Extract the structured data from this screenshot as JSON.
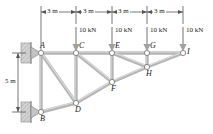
{
  "figure": {
    "type": "truss-free-body-diagram",
    "title": "",
    "colors": {
      "member": "#b9b9b9",
      "member_edge": "#8f8f8f",
      "node_fill": "#ffffff",
      "node_edge": "#6e6e6e",
      "dimension": "#4a4a4a",
      "load_arrow": "#9a9a9a",
      "support": "#c9c9c9",
      "text": "#1a1a1a"
    },
    "nodes": [
      {
        "id": "A",
        "x": 41,
        "y": 53,
        "label": "A",
        "label_dx": -1,
        "label_dy": -11
      },
      {
        "id": "B",
        "x": 41,
        "y": 112,
        "label": "B",
        "label_dx": -1,
        "label_dy": 3
      },
      {
        "id": "C",
        "x": 76,
        "y": 53,
        "label": "C",
        "label_dx": 3,
        "label_dy": -11
      },
      {
        "id": "D",
        "x": 76,
        "y": 103,
        "label": "D",
        "label_dx": -1,
        "label_dy": 3
      },
      {
        "id": "E",
        "x": 112,
        "y": 53,
        "label": "E",
        "label_dx": 3,
        "label_dy": -11
      },
      {
        "id": "F",
        "x": 112,
        "y": 82,
        "label": "F",
        "label_dx": 0,
        "label_dy": 3
      },
      {
        "id": "G",
        "x": 147,
        "y": 53,
        "label": "G",
        "label_dx": 3,
        "label_dy": -11
      },
      {
        "id": "H",
        "x": 147,
        "y": 67,
        "label": "H",
        "label_dx": 0,
        "label_dy": 3
      },
      {
        "id": "I",
        "x": 183,
        "y": 53,
        "label": "I",
        "label_dx": 4,
        "label_dy": -5
      }
    ],
    "members": [
      {
        "from": "A",
        "to": "C"
      },
      {
        "from": "C",
        "to": "E"
      },
      {
        "from": "E",
        "to": "G"
      },
      {
        "from": "G",
        "to": "I"
      },
      {
        "from": "B",
        "to": "D"
      },
      {
        "from": "D",
        "to": "F"
      },
      {
        "from": "F",
        "to": "H"
      },
      {
        "from": "H",
        "to": "I"
      },
      {
        "from": "A",
        "to": "B"
      },
      {
        "from": "C",
        "to": "D"
      },
      {
        "from": "E",
        "to": "F"
      },
      {
        "from": "G",
        "to": "H"
      },
      {
        "from": "A",
        "to": "D"
      },
      {
        "from": "C",
        "to": "F"
      },
      {
        "from": "E",
        "to": "H"
      }
    ],
    "loads": [
      {
        "at": "C",
        "magnitude": "10 kN",
        "direction": "down",
        "x": 76
      },
      {
        "at": "E",
        "magnitude": "10 kN",
        "direction": "down",
        "x": 112
      },
      {
        "at": "G",
        "magnitude": "10 kN",
        "direction": "down",
        "x": 147
      },
      {
        "at": "I",
        "magnitude": "10 kN",
        "direction": "down",
        "x": 183
      }
    ],
    "dimensions": {
      "horizontal": [
        {
          "label": "3 m",
          "from_x": 41,
          "to_x": 76
        },
        {
          "label": "3 m",
          "from_x": 76,
          "to_x": 112
        },
        {
          "label": "3 m",
          "from_x": 112,
          "to_x": 147
        },
        {
          "label": "3 m",
          "from_x": 147,
          "to_x": 183
        }
      ],
      "vertical": [
        {
          "label": "5 m",
          "from_y": 53,
          "to_y": 112,
          "x": 18
        }
      ]
    },
    "supports": [
      {
        "at": "A",
        "type": "pin",
        "x": 41,
        "y": 53
      },
      {
        "at": "B",
        "type": "pin",
        "x": 41,
        "y": 112
      }
    ]
  }
}
